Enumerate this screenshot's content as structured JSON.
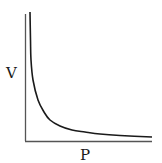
{
  "chart_data": {
    "type": "line",
    "title": "",
    "xlabel": "P",
    "ylabel": "V",
    "relationship": "inverse (V proportional to 1/P)",
    "grid": false,
    "legend": null,
    "ticks": {
      "x": [],
      "y": []
    },
    "series": [
      {
        "name": "V vs P",
        "points_px": [
          [
            30,
            12
          ],
          [
            30.5,
            40
          ],
          [
            31,
            60
          ],
          [
            33,
            80
          ],
          [
            38,
            100
          ],
          [
            44,
            112
          ],
          [
            50,
            120
          ],
          [
            60,
            126
          ],
          [
            72,
            130
          ],
          [
            85,
            132
          ],
          [
            100,
            134
          ],
          [
            120,
            135.5
          ],
          [
            152,
            137
          ]
        ]
      }
    ],
    "colors": {
      "axis": "#555555",
      "curve": "#1a1a1a",
      "background": "#ffffff"
    }
  }
}
